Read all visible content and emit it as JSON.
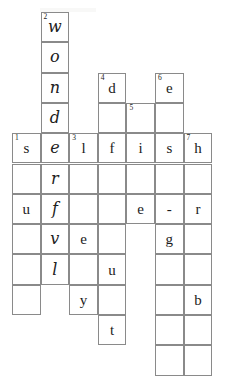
{
  "puzzle": {
    "type": "crossword",
    "title": "",
    "columns": 7,
    "rows": 12,
    "cell_width": 28.6,
    "cell_height": 30.3,
    "origin_x": 12,
    "origin_y": 12,
    "grid_line_color": "#8a8a8a",
    "background_color": "#ffffff",
    "ink_color": "#1b1b1b",
    "clue_numbers": [
      {
        "number": "1",
        "col": 1,
        "row": 4
      },
      {
        "number": "2",
        "col": 2,
        "row": 0
      },
      {
        "number": "3",
        "col": 3,
        "row": 4
      },
      {
        "number": "4",
        "col": 4,
        "row": 2
      },
      {
        "number": "5",
        "col": 5,
        "row": 3
      },
      {
        "number": "6",
        "col": 6,
        "row": 2
      },
      {
        "number": "7",
        "col": 7,
        "row": 4
      }
    ],
    "cells": [
      {
        "col": 2,
        "row": 0,
        "letter": "w",
        "hand": true,
        "clue": "2"
      },
      {
        "col": 2,
        "row": 1,
        "letter": "o",
        "hand": true,
        "clue": ""
      },
      {
        "col": 2,
        "row": 2,
        "letter": "n",
        "hand": true,
        "clue": ""
      },
      {
        "col": 4,
        "row": 2,
        "letter": "d",
        "hand": false,
        "clue": "4"
      },
      {
        "col": 6,
        "row": 2,
        "letter": "e",
        "hand": false,
        "clue": "6"
      },
      {
        "col": 2,
        "row": 3,
        "letter": "d",
        "hand": true,
        "clue": ""
      },
      {
        "col": 4,
        "row": 3,
        "letter": "",
        "hand": false,
        "clue": ""
      },
      {
        "col": 5,
        "row": 3,
        "letter": "",
        "hand": false,
        "clue": "5"
      },
      {
        "col": 6,
        "row": 3,
        "letter": "",
        "hand": false,
        "clue": ""
      },
      {
        "col": 1,
        "row": 4,
        "letter": "s",
        "hand": false,
        "clue": "1"
      },
      {
        "col": 2,
        "row": 4,
        "letter": "e",
        "hand": true,
        "clue": ""
      },
      {
        "col": 3,
        "row": 4,
        "letter": "l",
        "hand": false,
        "clue": "3"
      },
      {
        "col": 4,
        "row": 4,
        "letter": "f",
        "hand": false,
        "clue": ""
      },
      {
        "col": 5,
        "row": 4,
        "letter": "i",
        "hand": false,
        "clue": ""
      },
      {
        "col": 6,
        "row": 4,
        "letter": "s",
        "hand": false,
        "clue": ""
      },
      {
        "col": 7,
        "row": 4,
        "letter": "h",
        "hand": false,
        "clue": "7"
      },
      {
        "col": 1,
        "row": 5,
        "letter": "",
        "hand": false,
        "clue": ""
      },
      {
        "col": 2,
        "row": 5,
        "letter": "r",
        "hand": true,
        "clue": ""
      },
      {
        "col": 3,
        "row": 5,
        "letter": "",
        "hand": false,
        "clue": ""
      },
      {
        "col": 4,
        "row": 5,
        "letter": "",
        "hand": false,
        "clue": ""
      },
      {
        "col": 5,
        "row": 5,
        "letter": "",
        "hand": false,
        "clue": ""
      },
      {
        "col": 6,
        "row": 5,
        "letter": "",
        "hand": false,
        "clue": ""
      },
      {
        "col": 7,
        "row": 5,
        "letter": "",
        "hand": false,
        "clue": ""
      },
      {
        "col": 1,
        "row": 6,
        "letter": "u",
        "hand": false,
        "clue": ""
      },
      {
        "col": 2,
        "row": 6,
        "letter": "f",
        "hand": true,
        "clue": ""
      },
      {
        "col": 3,
        "row": 6,
        "letter": "",
        "hand": false,
        "clue": ""
      },
      {
        "col": 4,
        "row": 6,
        "letter": "",
        "hand": false,
        "clue": ""
      },
      {
        "col": 5,
        "row": 6,
        "letter": "e",
        "hand": false,
        "clue": ""
      },
      {
        "col": 6,
        "row": 6,
        "letter": "-",
        "hand": false,
        "clue": ""
      },
      {
        "col": 7,
        "row": 6,
        "letter": "r",
        "hand": false,
        "clue": ""
      },
      {
        "col": 1,
        "row": 7,
        "letter": "",
        "hand": false,
        "clue": ""
      },
      {
        "col": 2,
        "row": 7,
        "letter": "v",
        "hand": true,
        "clue": ""
      },
      {
        "col": 3,
        "row": 7,
        "letter": "e",
        "hand": false,
        "clue": ""
      },
      {
        "col": 4,
        "row": 7,
        "letter": "",
        "hand": false,
        "clue": ""
      },
      {
        "col": 6,
        "row": 7,
        "letter": "g",
        "hand": false,
        "clue": ""
      },
      {
        "col": 7,
        "row": 7,
        "letter": "",
        "hand": false,
        "clue": ""
      },
      {
        "col": 1,
        "row": 8,
        "letter": "",
        "hand": false,
        "clue": ""
      },
      {
        "col": 2,
        "row": 8,
        "letter": "l",
        "hand": true,
        "clue": ""
      },
      {
        "col": 3,
        "row": 8,
        "letter": "",
        "hand": false,
        "clue": ""
      },
      {
        "col": 4,
        "row": 8,
        "letter": "u",
        "hand": false,
        "clue": ""
      },
      {
        "col": 6,
        "row": 8,
        "letter": "",
        "hand": false,
        "clue": ""
      },
      {
        "col": 7,
        "row": 8,
        "letter": "",
        "hand": false,
        "clue": ""
      },
      {
        "col": 1,
        "row": 9,
        "letter": "",
        "hand": false,
        "clue": ""
      },
      {
        "col": 3,
        "row": 9,
        "letter": "y",
        "hand": false,
        "clue": ""
      },
      {
        "col": 4,
        "row": 9,
        "letter": "",
        "hand": false,
        "clue": ""
      },
      {
        "col": 6,
        "row": 9,
        "letter": "",
        "hand": false,
        "clue": ""
      },
      {
        "col": 7,
        "row": 9,
        "letter": "b",
        "hand": false,
        "clue": ""
      },
      {
        "col": 4,
        "row": 10,
        "letter": "t",
        "hand": false,
        "clue": ""
      },
      {
        "col": 6,
        "row": 10,
        "letter": "",
        "hand": false,
        "clue": ""
      },
      {
        "col": 7,
        "row": 10,
        "letter": "",
        "hand": false,
        "clue": ""
      },
      {
        "col": 6,
        "row": 11,
        "letter": "",
        "hand": false,
        "clue": ""
      },
      {
        "col": 7,
        "row": 11,
        "letter": "",
        "hand": false,
        "clue": ""
      }
    ],
    "answers": {
      "across": [
        {
          "number": "1",
          "text": "selfish"
        }
      ],
      "down": [
        {
          "number": "2",
          "text": "wonderful"
        }
      ]
    }
  }
}
